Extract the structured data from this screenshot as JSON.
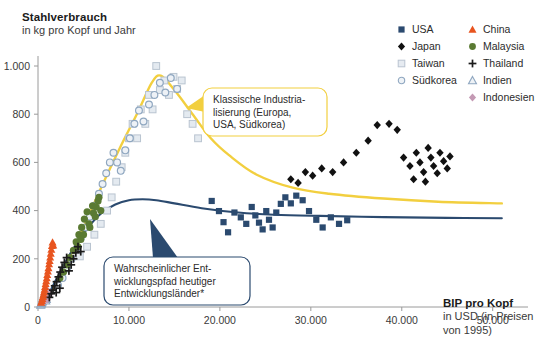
{
  "title": {
    "main": "Stahlverbrauch",
    "sub": "in kg pro Kopf und Jahr"
  },
  "xaxis_title": {
    "main": "BIP pro Kopf",
    "sub_line1": "in USD (in Preisen",
    "sub_line2": "von 1995)"
  },
  "legend": {
    "items": [
      {
        "label": "USA",
        "marker": "filled-square",
        "color": "#2b4a6f"
      },
      {
        "label": "China",
        "marker": "filled-triangle",
        "color": "#e8541f"
      },
      {
        "label": "Japan",
        "marker": "filled-diamond",
        "color": "#111111"
      },
      {
        "label": "Malaysia",
        "marker": "filled-circle",
        "color": "#5a7a32"
      },
      {
        "label": "Taiwan",
        "marker": "open-square",
        "color": "#c9d2dc"
      },
      {
        "label": "Thailand",
        "marker": "plus",
        "color": "#1b1b1b"
      },
      {
        "label": "Südkorea",
        "marker": "open-circle",
        "color": "#8fa7c0"
      },
      {
        "label": "Indien",
        "marker": "open-triangle",
        "color": "#8fa7c0"
      },
      {
        "label": "Indonesien",
        "marker": "filled-diamond-pink",
        "color": "#c49ab4"
      }
    ]
  },
  "callouts": [
    {
      "name": "klassische-industrialisierung",
      "lines": [
        "Klassische Industria-",
        "lisierung (Europa,",
        "USA, Südkorea)"
      ],
      "border_color": "#f2cf3f"
    },
    {
      "name": "entwicklungspfad",
      "lines": [
        "Wahrscheinlicher Ent-",
        "wicklungspfad heutiger",
        "Entwicklungsländer*"
      ],
      "border_color": "#2b4a6f"
    }
  ],
  "chart_data": {
    "type": "scatter",
    "title": "Stahlverbrauch in kg pro Kopf und Jahr",
    "xlabel": "BIP pro Kopf in USD (in Preisen von 1995)",
    "ylabel": "Stahlverbrauch in kg pro Kopf und Jahr",
    "xlim": [
      0,
      53000
    ],
    "ylim": [
      0,
      1060
    ],
    "xticks": [
      0,
      10000,
      20000,
      30000,
      40000,
      50000
    ],
    "xtick_labels": [
      "0",
      "10.000",
      "20.000",
      "30.000",
      "40.000",
      "50.000"
    ],
    "yticks": [
      0,
      200,
      400,
      600,
      800,
      1000
    ],
    "ytick_labels": [
      "0",
      "200",
      "400",
      "600",
      "800",
      "1.000"
    ],
    "grid": false,
    "legend_position": "top-right",
    "series": [
      {
        "name": "USA",
        "marker": "filled-square",
        "color": "#2b4a6f",
        "points": [
          [
            19100,
            440
          ],
          [
            19900,
            398
          ],
          [
            20400,
            352
          ],
          [
            20900,
            310
          ],
          [
            21600,
            392
          ],
          [
            22300,
            372
          ],
          [
            22900,
            345
          ],
          [
            23500,
            415
          ],
          [
            23900,
            380
          ],
          [
            24300,
            350
          ],
          [
            24700,
            322
          ],
          [
            25100,
            398
          ],
          [
            25400,
            362
          ],
          [
            25800,
            330
          ],
          [
            26200,
            392
          ],
          [
            26700,
            428
          ],
          [
            27200,
            455
          ],
          [
            27800,
            430
          ],
          [
            28400,
            462
          ],
          [
            29100,
            443
          ],
          [
            29800,
            398
          ],
          [
            30600,
            362
          ],
          [
            31300,
            330
          ],
          [
            32200,
            372
          ],
          [
            33100,
            345
          ],
          [
            34000,
            360
          ]
        ]
      },
      {
        "name": "Japan",
        "marker": "filled-diamond",
        "color": "#111111",
        "points": [
          [
            27800,
            530
          ],
          [
            28600,
            515
          ],
          [
            29400,
            560
          ],
          [
            30200,
            545
          ],
          [
            31200,
            575
          ],
          [
            32400,
            560
          ],
          [
            33600,
            600
          ],
          [
            35000,
            640
          ],
          [
            36300,
            690
          ],
          [
            37300,
            755
          ],
          [
            38600,
            760
          ],
          [
            39500,
            735
          ],
          [
            40200,
            620
          ],
          [
            40900,
            585
          ],
          [
            41600,
            640
          ],
          [
            42000,
            600
          ],
          [
            42400,
            560
          ],
          [
            42900,
            660
          ],
          [
            43200,
            620
          ],
          [
            43500,
            585
          ],
          [
            43900,
            555
          ],
          [
            44200,
            640
          ],
          [
            44600,
            605
          ],
          [
            45000,
            575
          ],
          [
            45300,
            625
          ],
          [
            41300,
            530
          ],
          [
            42600,
            520
          ]
        ]
      },
      {
        "name": "Taiwan",
        "marker": "open-square",
        "color": "#c9d2dc",
        "points": [
          [
            4600,
            210
          ],
          [
            5400,
            250
          ],
          [
            6200,
            300
          ],
          [
            6900,
            345
          ],
          [
            7600,
            400
          ],
          [
            8100,
            455
          ],
          [
            8600,
            520
          ],
          [
            9200,
            580
          ],
          [
            9600,
            640
          ],
          [
            10000,
            700
          ],
          [
            10400,
            760
          ],
          [
            10900,
            700
          ],
          [
            11300,
            820
          ],
          [
            11800,
            760
          ],
          [
            12200,
            880
          ],
          [
            12600,
            820
          ],
          [
            13000,
            1000
          ],
          [
            13400,
            900
          ],
          [
            13900,
            940
          ],
          [
            14400,
            880
          ],
          [
            14900,
            955
          ],
          [
            15300,
            905
          ],
          [
            15800,
            940
          ],
          [
            16400,
            800
          ],
          [
            17000,
            760
          ],
          [
            17600,
            700
          ]
        ]
      },
      {
        "name": "Südkorea",
        "marker": "open-circle",
        "color": "#8fa7c0",
        "points": [
          [
            2200,
            90
          ],
          [
            2700,
            120
          ],
          [
            3200,
            160
          ],
          [
            3700,
            200
          ],
          [
            4200,
            240
          ],
          [
            4700,
            285
          ],
          [
            5200,
            330
          ],
          [
            5700,
            375
          ],
          [
            6200,
            420
          ],
          [
            6700,
            470
          ],
          [
            7100,
            510
          ],
          [
            7500,
            555
          ],
          [
            7900,
            600
          ],
          [
            8300,
            640
          ],
          [
            8700,
            600
          ],
          [
            9100,
            565
          ],
          [
            9600,
            650
          ],
          [
            10100,
            700
          ],
          [
            10600,
            760
          ],
          [
            11100,
            815
          ],
          [
            11600,
            770
          ],
          [
            12200,
            840
          ],
          [
            12800,
            880
          ],
          [
            13400,
            930
          ],
          [
            14000,
            890
          ],
          [
            14600,
            950
          ],
          [
            15300,
            905
          ]
        ]
      },
      {
        "name": "China",
        "marker": "filled-triangle",
        "color": "#e8541f",
        "points": [
          [
            350,
            18
          ],
          [
            420,
            26
          ],
          [
            480,
            34
          ],
          [
            540,
            42
          ],
          [
            600,
            52
          ],
          [
            660,
            62
          ],
          [
            720,
            72
          ],
          [
            780,
            84
          ],
          [
            840,
            96
          ],
          [
            900,
            108
          ],
          [
            960,
            120
          ],
          [
            1020,
            134
          ],
          [
            1090,
            148
          ],
          [
            1150,
            162
          ],
          [
            1220,
            178
          ],
          [
            1280,
            192
          ],
          [
            1340,
            206
          ],
          [
            1400,
            222
          ],
          [
            1470,
            238
          ],
          [
            1530,
            254
          ],
          [
            1600,
            268
          ],
          [
            1680,
            256
          ]
        ]
      },
      {
        "name": "Malaysia",
        "marker": "filled-circle",
        "color": "#5a7a32",
        "points": [
          [
            2400,
            120
          ],
          [
            2800,
            145
          ],
          [
            3200,
            175
          ],
          [
            3500,
            205
          ],
          [
            3900,
            235
          ],
          [
            4200,
            270
          ],
          [
            4500,
            300
          ],
          [
            4800,
            330
          ],
          [
            5100,
            365
          ],
          [
            5400,
            395
          ],
          [
            5700,
            330
          ],
          [
            6000,
            420
          ],
          [
            6300,
            375
          ],
          [
            6600,
            440
          ],
          [
            6900,
            400
          ],
          [
            5000,
            300
          ],
          [
            5600,
            345
          ],
          [
            4400,
            250
          ],
          [
            4700,
            280
          ],
          [
            6100,
            390
          ],
          [
            6400,
            415
          ],
          [
            6700,
            455
          ]
        ]
      },
      {
        "name": "Thailand",
        "marker": "plus",
        "color": "#1b1b1b",
        "points": [
          [
            1250,
            40
          ],
          [
            1450,
            55
          ],
          [
            1650,
            70
          ],
          [
            1850,
            88
          ],
          [
            2050,
            105
          ],
          [
            2250,
            125
          ],
          [
            2450,
            145
          ],
          [
            2650,
            165
          ],
          [
            2900,
            185
          ],
          [
            3150,
            205
          ],
          [
            3400,
            150
          ],
          [
            3650,
            175
          ],
          [
            3900,
            200
          ],
          [
            4150,
            225
          ],
          [
            4400,
            250
          ],
          [
            4700,
            230
          ],
          [
            2000,
            60
          ],
          [
            2400,
            78
          ]
        ]
      },
      {
        "name": "Indien",
        "marker": "open-triangle",
        "color": "#8fa7c0",
        "points": [
          [
            300,
            8
          ],
          [
            340,
            12
          ],
          [
            380,
            16
          ],
          [
            420,
            20
          ],
          [
            460,
            24
          ],
          [
            500,
            28
          ],
          [
            540,
            32
          ],
          [
            590,
            36
          ],
          [
            640,
            42
          ],
          [
            690,
            48
          ],
          [
            740,
            54
          ],
          [
            790,
            60
          ],
          [
            850,
            26
          ],
          [
            910,
            32
          ]
        ]
      },
      {
        "name": "Indonesien",
        "marker": "filled-diamond-pink",
        "color": "#c49ab4",
        "points": [
          [
            620,
            22
          ],
          [
            700,
            28
          ],
          [
            780,
            34
          ],
          [
            860,
            42
          ],
          [
            940,
            50
          ],
          [
            1020,
            58
          ],
          [
            1100,
            66
          ],
          [
            1180,
            44
          ],
          [
            1260,
            52
          ],
          [
            1340,
            60
          ],
          [
            880,
            36
          ],
          [
            1000,
            30
          ]
        ]
      }
    ],
    "trend_curves": [
      {
        "name": "klassische-industrialisierung-kurve",
        "color": "#f2cf3f",
        "description": "Steiler Anstieg bis Peak bei ca. 13.000 USD / 960 kg, dann Rückgang auf ca. 430 kg",
        "points": [
          [
            1000,
            30
          ],
          [
            3000,
            170
          ],
          [
            5000,
            330
          ],
          [
            7000,
            500
          ],
          [
            9000,
            660
          ],
          [
            11000,
            810
          ],
          [
            12500,
            930
          ],
          [
            13500,
            960
          ],
          [
            15000,
            900
          ],
          [
            17000,
            800
          ],
          [
            19000,
            700
          ],
          [
            21000,
            630
          ],
          [
            24000,
            550
          ],
          [
            28000,
            495
          ],
          [
            32000,
            470
          ],
          [
            38000,
            450
          ],
          [
            44000,
            437
          ],
          [
            51000,
            430
          ]
        ]
      },
      {
        "name": "entwicklungspfad-kurve",
        "color": "#2b4a6f",
        "description": "Flacherer Anstieg bis Plateau bei ca. 445 kg, dann leichter Rückgang auf ca. 370 kg",
        "points": [
          [
            800,
            25
          ],
          [
            2500,
            150
          ],
          [
            4000,
            250
          ],
          [
            5500,
            330
          ],
          [
            7000,
            390
          ],
          [
            8500,
            425
          ],
          [
            10000,
            443
          ],
          [
            11500,
            447
          ],
          [
            13000,
            443
          ],
          [
            15000,
            430
          ],
          [
            18000,
            410
          ],
          [
            22000,
            392
          ],
          [
            26000,
            383
          ],
          [
            31000,
            378
          ],
          [
            38000,
            373
          ],
          [
            45000,
            370
          ],
          [
            51000,
            368
          ]
        ]
      }
    ]
  }
}
